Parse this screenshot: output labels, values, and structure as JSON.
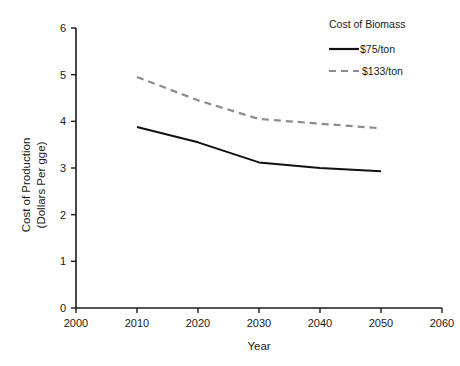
{
  "chart_data": {
    "type": "line",
    "title": "",
    "xlabel": "Year",
    "ylabel": "Cost of Production (Dollars Per gge)",
    "ylabel_line1": "Cost of Production",
    "ylabel_line2": "(Dollars Per gge)",
    "x": [
      2010,
      2020,
      2030,
      2040,
      2050
    ],
    "xlim": [
      2000,
      2060
    ],
    "ylim": [
      0,
      6
    ],
    "xticks": [
      2000,
      2010,
      2020,
      2030,
      2040,
      2050,
      2060
    ],
    "xtick_labels": [
      "2000",
      "2010",
      "2020",
      "2030",
      "2040",
      "2050",
      "2060"
    ],
    "yticks": [
      0,
      1,
      2,
      3,
      4,
      5,
      6
    ],
    "ytick_labels": [
      "0",
      "1",
      "2",
      "3",
      "4",
      "5",
      "6"
    ],
    "grid": false,
    "legend_position": "top-right",
    "legend_title": "Cost of Biomass",
    "series": [
      {
        "name": "$75/ton",
        "style": "solid",
        "color": "#111111",
        "values": [
          3.88,
          3.55,
          3.12,
          3.0,
          2.93
        ]
      },
      {
        "name": "$133/ton",
        "style": "dashed",
        "color": "#8c8c8c",
        "values": [
          4.95,
          4.45,
          4.05,
          3.95,
          3.85
        ]
      }
    ]
  },
  "axes": {
    "x_title": "Year",
    "y_title_line1": "Cost of Production",
    "y_title_line2": "(Dollars Per gge)"
  },
  "legend": {
    "title": "Cost of Biomass",
    "items": [
      {
        "label": "$75/ton"
      },
      {
        "label": "$133/ton"
      }
    ]
  },
  "colors": {
    "series_solid": "#111111",
    "series_dashed": "#8c8c8c",
    "axis": "#1a1a1a",
    "background": "#ffffff"
  }
}
